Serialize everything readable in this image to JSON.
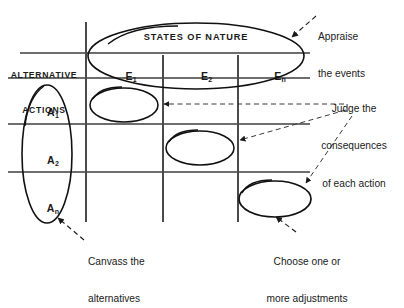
{
  "diagram": {
    "ink_color": "#111111",
    "grid_color": "#6b6b6b",
    "dash_color": "#3a3a3a"
  },
  "table": {
    "header_title": "STATES OF NATURE",
    "side_label_line1": "ALTERNATIVE",
    "side_label_line2": "ACTIONS",
    "columns": [
      {
        "base": "E",
        "sub": "1",
        "label": "E1"
      },
      {
        "base": "E",
        "sub": "2",
        "label": "E2"
      },
      {
        "base": "E",
        "sub": "n",
        "label": "En"
      }
    ],
    "rows": [
      {
        "base": "A",
        "sub": "1",
        "label": "A1"
      },
      {
        "base": "A",
        "sub": "2",
        "label": "A2"
      },
      {
        "base": "A",
        "sub": "n",
        "label": "An"
      }
    ]
  },
  "annotations": [
    {
      "id": "appraise",
      "line1": "Appraise",
      "line2": "the events",
      "points_to": "states-of-nature-ellipse"
    },
    {
      "id": "judge",
      "line1": "Judge the",
      "line2": "consequences",
      "line3": "of each action",
      "points_to": "cell-ellipses"
    },
    {
      "id": "canvass",
      "line1": "Canvass the",
      "line2": "alternatives",
      "points_to": "alternative-actions-ellipse"
    },
    {
      "id": "choose",
      "line1": "Choose one or",
      "line2": "more adjustments",
      "points_to": "adjustment-ellipse"
    }
  ],
  "highlight_ellipses": [
    {
      "id": "states-of-nature-ellipse",
      "encircles": "STATES OF NATURE header and E columns"
    },
    {
      "id": "alternative-actions-ellipse",
      "encircles": "A1 A2 An row labels"
    },
    {
      "id": "cell-ellipse-a1e1",
      "encircles": "cell A1 / E1"
    },
    {
      "id": "cell-ellipse-a2e2",
      "encircles": "cell A2 / E2"
    },
    {
      "id": "adjustment-ellipse",
      "encircles": "cell An / En"
    }
  ]
}
